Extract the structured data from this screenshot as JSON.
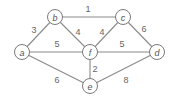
{
  "diagram": {
    "type": "weighted-undirected-graph",
    "colors": {
      "edge": "#8a8a8a",
      "node_stroke": "#7a7a7a",
      "node_fill": "#ffffff",
      "text": "#555555",
      "background": "#ffffff"
    },
    "nodes": [
      {
        "id": "a",
        "label": "a",
        "x": 22,
        "y": 52
      },
      {
        "id": "b",
        "label": "b",
        "x": 55,
        "y": 17
      },
      {
        "id": "c",
        "label": "c",
        "x": 123,
        "y": 17
      },
      {
        "id": "d",
        "label": "d",
        "x": 157,
        "y": 52
      },
      {
        "id": "e",
        "label": "e",
        "x": 90,
        "y": 86
      },
      {
        "id": "f",
        "label": "f",
        "x": 90,
        "y": 52
      }
    ],
    "edges": [
      {
        "from": "b",
        "to": "c",
        "weight": "1",
        "label_x": 88,
        "label_y": 9
      },
      {
        "from": "a",
        "to": "b",
        "weight": "3",
        "label_x": 34,
        "label_y": 30
      },
      {
        "from": "b",
        "to": "f",
        "weight": "4",
        "label_x": 78,
        "label_y": 32
      },
      {
        "from": "c",
        "to": "f",
        "weight": "4",
        "label_x": 102,
        "label_y": 32
      },
      {
        "from": "c",
        "to": "d",
        "weight": "6",
        "label_x": 144,
        "label_y": 29
      },
      {
        "from": "a",
        "to": "f",
        "weight": "5",
        "label_x": 57,
        "label_y": 44
      },
      {
        "from": "f",
        "to": "d",
        "weight": "5",
        "label_x": 122,
        "label_y": 44
      },
      {
        "from": "f",
        "to": "e",
        "weight": "2",
        "label_x": 95,
        "label_y": 69
      },
      {
        "from": "a",
        "to": "e",
        "weight": "6",
        "label_x": 57,
        "label_y": 80
      },
      {
        "from": "e",
        "to": "d",
        "weight": "8",
        "label_x": 126,
        "label_y": 80
      }
    ]
  }
}
